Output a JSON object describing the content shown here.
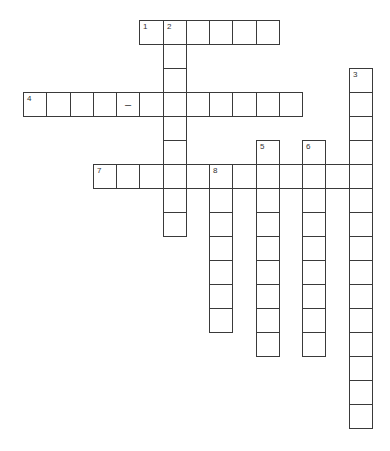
{
  "puzzle": {
    "type": "crossword",
    "grid": {
      "origin_x": 23,
      "origin_y": 20,
      "cell_w": 23.25,
      "cell_h": 24
    },
    "colors": {
      "line": "#3a3a3a",
      "number": "#333333",
      "background": "#ffffff"
    },
    "entries": [
      {
        "number": "1",
        "direction": "across",
        "row": 0,
        "col": 5,
        "length": 6
      },
      {
        "number": "2",
        "direction": "down",
        "row": 0,
        "col": 6,
        "length": 9
      },
      {
        "number": "3",
        "direction": "down",
        "row": 2,
        "col": 14,
        "length": 15
      },
      {
        "number": "4",
        "direction": "across",
        "row": 3,
        "col": 0,
        "length": 12
      },
      {
        "number": "5",
        "direction": "down",
        "row": 5,
        "col": 10,
        "length": 9
      },
      {
        "number": "6",
        "direction": "down",
        "row": 5,
        "col": 12,
        "length": 9
      },
      {
        "number": "7",
        "direction": "across",
        "row": 6,
        "col": 3,
        "length": 12
      },
      {
        "number": "8",
        "direction": "down",
        "row": 6,
        "col": 8,
        "length": 7
      }
    ],
    "prefilled": [
      {
        "row": 3,
        "col": 4,
        "text": "–"
      }
    ]
  }
}
